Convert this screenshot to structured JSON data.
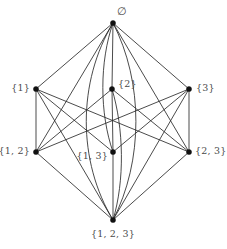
{
  "figure": {
    "type": "hasse-diagram",
    "title": "",
    "background_color": "#ffffff",
    "edge_color": "#2b2b2b",
    "vertex_color": "#111111",
    "label_color": "#4a4a4a"
  },
  "nodes": [
    {
      "id": "empty",
      "label": "∅",
      "x": 113,
      "y": 23,
      "label_x": 122,
      "label_y": 11,
      "anchor": "mid",
      "rank": 0
    },
    {
      "id": "s1",
      "label": "{1}",
      "x": 36,
      "y": 89,
      "label_x": 30,
      "label_y": 88,
      "anchor": "right",
      "rank": 1
    },
    {
      "id": "s2",
      "label": "{2}",
      "x": 112,
      "y": 89,
      "label_x": 118,
      "label_y": 84,
      "anchor": "left",
      "rank": 1
    },
    {
      "id": "s3",
      "label": "{3}",
      "x": 189,
      "y": 89,
      "label_x": 196,
      "label_y": 88,
      "anchor": "left",
      "rank": 1
    },
    {
      "id": "s12",
      "label": "{1, 2}",
      "x": 36,
      "y": 152,
      "label_x": 30,
      "label_y": 151,
      "anchor": "right",
      "rank": 2
    },
    {
      "id": "s13",
      "label": "{1, 3}",
      "x": 113,
      "y": 152,
      "label_x": 108,
      "label_y": 156,
      "anchor": "right",
      "rank": 2
    },
    {
      "id": "s23",
      "label": "{2, 3}",
      "x": 189,
      "y": 152,
      "label_x": 195,
      "label_y": 151,
      "anchor": "left",
      "rank": 2
    },
    {
      "id": "s123",
      "label": "{1, 2, 3}",
      "x": 113,
      "y": 220,
      "label_x": 113,
      "label_y": 234,
      "anchor": "mid",
      "rank": 3
    }
  ],
  "edges": [
    {
      "from": "empty",
      "to": "s1",
      "shape": "straight"
    },
    {
      "from": "empty",
      "to": "s2",
      "shape": "straight"
    },
    {
      "from": "empty",
      "to": "s3",
      "shape": "straight"
    },
    {
      "from": "empty",
      "to": "s12",
      "shape": "straight"
    },
    {
      "from": "empty",
      "to": "s13",
      "shape": "curved-left"
    },
    {
      "from": "empty",
      "to": "s23",
      "shape": "straight"
    },
    {
      "from": "empty",
      "to": "s123",
      "shape": "curved-left-wide"
    },
    {
      "from": "empty",
      "to": "s123",
      "shape": "curved-right-wide"
    },
    {
      "from": "s1",
      "to": "s12",
      "shape": "straight"
    },
    {
      "from": "s1",
      "to": "s13",
      "shape": "straight"
    },
    {
      "from": "s1",
      "to": "s23",
      "shape": "straight"
    },
    {
      "from": "s1",
      "to": "s123",
      "shape": "straight"
    },
    {
      "from": "s2",
      "to": "s12",
      "shape": "straight"
    },
    {
      "from": "s2",
      "to": "s13",
      "shape": "straight"
    },
    {
      "from": "s2",
      "to": "s23",
      "shape": "straight"
    },
    {
      "from": "s2",
      "to": "s123",
      "shape": "curved-right"
    },
    {
      "from": "s3",
      "to": "s12",
      "shape": "straight"
    },
    {
      "from": "s3",
      "to": "s13",
      "shape": "straight"
    },
    {
      "from": "s3",
      "to": "s23",
      "shape": "straight"
    },
    {
      "from": "s3",
      "to": "s123",
      "shape": "straight"
    },
    {
      "from": "s12",
      "to": "s123",
      "shape": "straight"
    },
    {
      "from": "s13",
      "to": "s123",
      "shape": "straight"
    },
    {
      "from": "s23",
      "to": "s123",
      "shape": "straight"
    }
  ],
  "chart_data": {
    "type": "diagram",
    "levels": [
      {
        "rank": 0,
        "members": [
          "∅"
        ]
      },
      {
        "rank": 1,
        "members": [
          "{1}",
          "{2}",
          "{3}"
        ]
      },
      {
        "rank": 2,
        "members": [
          "{1, 2}",
          "{1, 3}",
          "{2, 3}"
        ]
      },
      {
        "rank": 3,
        "members": [
          "{1, 2, 3}"
        ]
      }
    ],
    "node_count": 8,
    "edge_count": 23
  }
}
